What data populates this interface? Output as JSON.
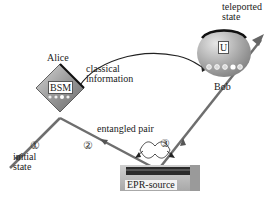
{
  "diagram": {
    "nodes": {
      "alice": {
        "label": "Alice",
        "device": "BSM"
      },
      "bob": {
        "label": "Bob",
        "device": "U"
      },
      "source": {
        "label": "EPR-source"
      }
    },
    "labels": {
      "classical": "classical information",
      "classical_line1": "classical",
      "classical_line2": "information",
      "entangled": "entangled pair",
      "initial_line1": "initial",
      "initial_line2": "state",
      "teleported_line1": "teleported",
      "teleported_line2": "state"
    },
    "channels": [
      {
        "id": 1,
        "marker": "①",
        "from": "initial state",
        "to": "Alice"
      },
      {
        "id": 2,
        "marker": "②",
        "from": "EPR-source",
        "to": "Alice"
      },
      {
        "id": 3,
        "marker": "③",
        "from": "EPR-source",
        "to": "Bob"
      }
    ],
    "colors": {
      "line": "#6e6e6e",
      "bsm_fill": "#8c8c8c",
      "bob_fill": "#9a9a9a",
      "source_base": "#bdbdbd",
      "source_crystal": "#2a2a2a"
    }
  }
}
